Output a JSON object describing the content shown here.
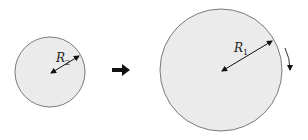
{
  "diagram": {
    "small_disk": {
      "label_main": "R",
      "label_sub": "2",
      "cx": 50,
      "cy": 72,
      "r": 35
    },
    "transition_arrow": "right-arrow",
    "large_disk": {
      "label_main": "R",
      "label_sub": "1",
      "cx": 221,
      "cy": 70,
      "r": 61,
      "rotation": "clockwise"
    },
    "colors": {
      "disk_fill": "#ebebeb",
      "disk_stroke": "#7a7a7a",
      "arrow": "#111111"
    }
  }
}
